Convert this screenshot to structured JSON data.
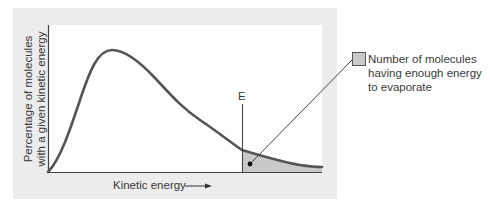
{
  "diagram": {
    "title": "",
    "y_axis_label": {
      "line1": "Percentage of molecules",
      "line2": "with a given kinetic energy"
    },
    "x_axis_label": "Kinetic energy",
    "x_axis_arrow": "arrow-right-icon",
    "threshold_marker": "E",
    "legend": {
      "swatch_color": "#c9c9c9",
      "line1": "Number of molecules",
      "line2": "having enough energy",
      "line3": "to evaporate"
    },
    "colors": {
      "panel_background": "#ececec",
      "plot_background": "#ffffff",
      "curve": "#555555",
      "shaded_region": "#c9c9c9",
      "axis": "#444444",
      "text": "#3a3a3a"
    },
    "curve_description": "Right-skewed distribution of molecular kinetic energies (Maxwell-Boltzmann-like), rising from origin to a peak then decaying with a long tail; region beyond threshold E is shaded"
  }
}
